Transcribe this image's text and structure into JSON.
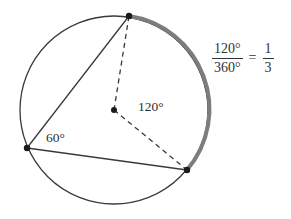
{
  "figure": {
    "labels": {
      "central_angle": "120°",
      "inscribed_angle": "60°"
    },
    "equation": {
      "fraction_numerator": "120°",
      "fraction_denominator": "360°",
      "equals": "=",
      "result_numerator": "1",
      "result_denominator": "3"
    },
    "colors": {
      "circle_stroke": "#3a3a3a",
      "highlight_arc": "#7d7d7d",
      "chord_stroke": "#3a3a3a",
      "dashed_stroke": "#3a3a3a",
      "point_fill": "#1a1a1a",
      "text": "#2f2f2f",
      "background": "#ffffff"
    },
    "geometry": {
      "center": {
        "x": 114,
        "y": 110
      },
      "radius": 94,
      "points": {
        "top": {
          "x": 129,
          "y": 16
        },
        "lower_right": {
          "x": 187,
          "y": 170
        },
        "left": {
          "x": 27,
          "y": 148
        }
      },
      "highlight_arc_degrees": 120,
      "full_circle_degrees": 360
    }
  }
}
